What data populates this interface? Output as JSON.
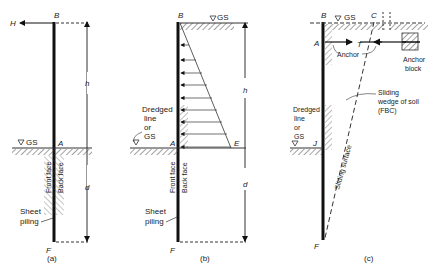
{
  "panels": [
    {
      "caption": "(a)",
      "points": {
        "B": "B",
        "A": "A",
        "F": "F"
      },
      "force": "H",
      "dims": {
        "h": "h",
        "d": "d"
      },
      "gs": "GS",
      "faces": {
        "front": "Front face",
        "back": "Back face"
      },
      "piling": [
        "Sheet",
        "piling"
      ]
    },
    {
      "caption": "(b)",
      "points": {
        "B": "B",
        "A": "A",
        "E": "E",
        "F": "F"
      },
      "dims": {
        "h": "h",
        "d": "d"
      },
      "gs": "GS",
      "dredged": [
        "Dredged",
        "line",
        "or",
        "GS"
      ],
      "faces": {
        "front": "Front face",
        "back": "Back face"
      },
      "piling": [
        "Sheet",
        "piling"
      ]
    },
    {
      "caption": "(c)",
      "points": {
        "B": "B",
        "C": "C",
        "A": "A",
        "J": "J",
        "F": "F"
      },
      "force": "T",
      "gs": "GS",
      "anchor": "Anchor",
      "anchor_block": [
        "Anchor",
        "block"
      ],
      "dredged": [
        "Dredged",
        "line",
        "or",
        "GS"
      ],
      "wedge": [
        "Sliding",
        "wedge of soil",
        "(FBC)"
      ],
      "surface": "Sliding surface"
    }
  ]
}
